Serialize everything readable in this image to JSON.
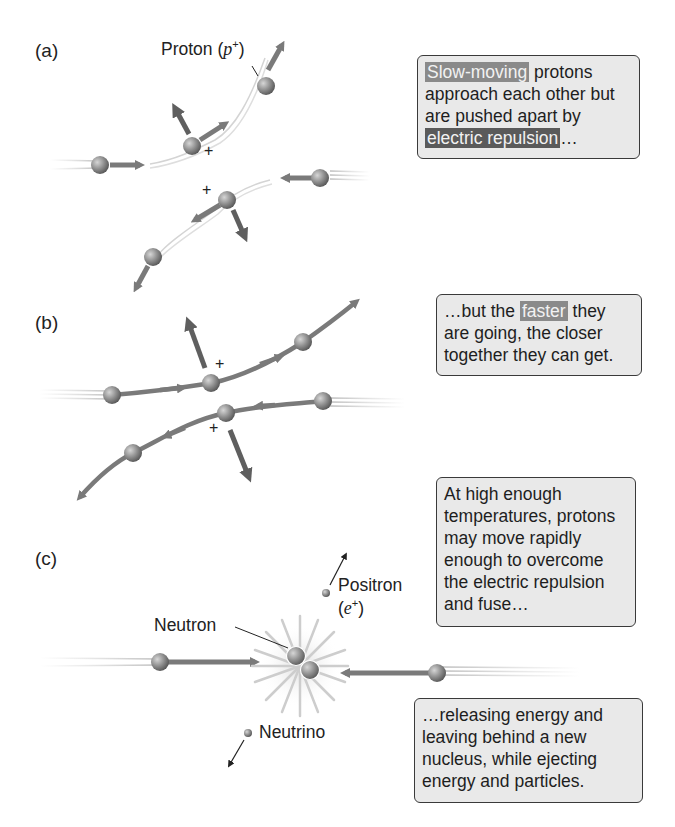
{
  "panels": [
    {
      "id": "a",
      "label": "(a)",
      "particle_label": {
        "name": "Proton",
        "symbol": "p",
        "charge": "+"
      },
      "caption": {
        "highlight1": "Slow-moving",
        "text1": " protons approach each other but are pushed apart by ",
        "highlight2": "electric repulsion",
        "text2": "…"
      }
    },
    {
      "id": "b",
      "label": "(b)",
      "caption": {
        "text1": "…but the ",
        "highlight1": "faster",
        "text2": " they are going, the closer together they can get."
      }
    },
    {
      "id": "c",
      "label": "(c)",
      "labels": {
        "positron_name": "Positron",
        "positron_symbol": "e",
        "positron_charge": "+",
        "neutron": "Neutron",
        "neutrino": "Neutrino"
      },
      "caption_top": "At high enough temperatures, protons may move rapidly enough to overcome the electric repulsion and fuse…",
      "caption_bottom": "…releasing energy and leaving behind a new nucleus, while ejecting energy and particles."
    }
  ],
  "charge_symbol": "+",
  "colors": {
    "box_fill": "#e9e9e9",
    "box_border": "#3a3a3a",
    "highlight_light": "#8a8a8a",
    "highlight_dark": "#5a5a5a",
    "arrow": "#7a7a7a",
    "force_arrow": "#5f5f5f",
    "proton": "#8c8c8c"
  }
}
